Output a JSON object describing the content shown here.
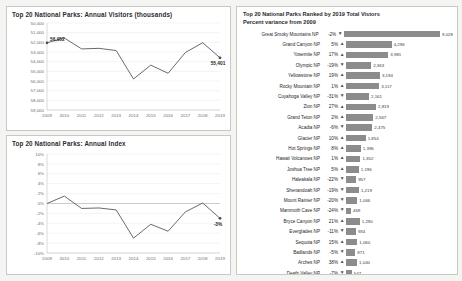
{
  "dashboard": {
    "background": "#f4f4f2",
    "accent": "#8c8c8c"
  },
  "visitors_panel": {
    "title": "Top 20 National Parks:  Annual Visitors (thousands)"
  },
  "index_panel": {
    "title": "Top 20 National Parks:  Annual Index"
  },
  "ranked_panel": {
    "title_line1": "Top 20 National Parks Ranked by 2019 Total Vistors",
    "title_line2": "Percent variance from 2009",
    "arrow_up": "▲",
    "arrow_down": "▼",
    "rows": [
      {
        "name": "Great Smoky Mountains NP",
        "pct": "-2%",
        "dir": "down",
        "value": "9,028",
        "value_num": 9028
      },
      {
        "name": "Grand Canyon NP",
        "pct": "5%",
        "dir": "up",
        "value": "4,296",
        "value_num": 4296
      },
      {
        "name": "Yosemite NP",
        "pct": "17%",
        "dir": "up",
        "value": "3,981",
        "value_num": 3981
      },
      {
        "name": "Olympic NP",
        "pct": "-19%",
        "dir": "down",
        "value": "2,363",
        "value_num": 2363
      },
      {
        "name": "Yellowstone NP",
        "pct": "19%",
        "dir": "up",
        "value": "3,194",
        "value_num": 3194
      },
      {
        "name": "Rocky Mountain NP",
        "pct": "1%",
        "dir": "up",
        "value": "3,117",
        "value_num": 3117
      },
      {
        "name": "Cuyahoga Valley NP",
        "pct": "-31%",
        "dir": "down",
        "value": "2,161",
        "value_num": 2161
      },
      {
        "name": "Zion NP",
        "pct": "27%",
        "dir": "up",
        "value": "2,819",
        "value_num": 2819
      },
      {
        "name": "Grand Teton NP",
        "pct": "2%",
        "dir": "up",
        "value": "2,567",
        "value_num": 2567
      },
      {
        "name": "Acadia NP",
        "pct": "-6%",
        "dir": "down",
        "value": "2,475",
        "value_num": 2475
      },
      {
        "name": "Glacier NP",
        "pct": "10%",
        "dir": "up",
        "value": "1,854",
        "value_num": 1854
      },
      {
        "name": "Hot Springs NP",
        "pct": "8%",
        "dir": "up",
        "value": "1,396",
        "value_num": 1396
      },
      {
        "name": "Hawaii Volcanoes NP",
        "pct": "1%",
        "dir": "up",
        "value": "1,352",
        "value_num": 1352
      },
      {
        "name": "Joshua Tree NP",
        "pct": "5%",
        "dir": "up",
        "value": "1,196",
        "value_num": 1196
      },
      {
        "name": "Haleakala NP",
        "pct": "-22%",
        "dir": "down",
        "value": "957",
        "value_num": 957
      },
      {
        "name": "Shenandoah NP",
        "pct": "-19%",
        "dir": "down",
        "value": "1,219",
        "value_num": 1219
      },
      {
        "name": "Mount Rainier NP",
        "pct": "-20%",
        "dir": "down",
        "value": "1,066",
        "value_num": 1066
      },
      {
        "name": "Mammoth Cave NP",
        "pct": "-24%",
        "dir": "down",
        "value": "469",
        "value_num": 469
      },
      {
        "name": "Bryce Canyon NP",
        "pct": "21%",
        "dir": "up",
        "value": "1,290",
        "value_num": 1290
      },
      {
        "name": "Everglades NP",
        "pct": "-11%",
        "dir": "down",
        "value": "934",
        "value_num": 934
      },
      {
        "name": "Sequoia NP",
        "pct": "15%",
        "dir": "up",
        "value": "1,060",
        "value_num": 1060
      },
      {
        "name": "Badlands NP",
        "pct": "-5%",
        "dir": "down",
        "value": "871",
        "value_num": 871
      },
      {
        "name": "Arches NP",
        "pct": "38%",
        "dir": "up",
        "value": "1,040",
        "value_num": 1040
      },
      {
        "name": "Death Valley NP",
        "pct": "-7%",
        "dir": "down",
        "value": "547",
        "value_num": 547
      },
      {
        "name": "Saguaro NP",
        "pct": "-18%",
        "dir": "down",
        "value": "610",
        "value_num": 610
      },
      {
        "name": "Wind Cave NP",
        "pct": "-17%",
        "dir": "down",
        "value": "598",
        "value_num": 598
      },
      {
        "name": "Virgin Islands NP",
        "pct": "-20%",
        "dir": "down",
        "value": "402",
        "value_num": 402
      },
      {
        "name": "Petrified Forest NP",
        "pct": "5%",
        "dir": "up",
        "value": "614",
        "value_num": 614
      },
      {
        "name": "Capitol Reef NP",
        "pct": "27%",
        "dir": "up",
        "value": "669",
        "value_num": 669
      }
    ]
  },
  "chart_data": [
    {
      "type": "line",
      "id": "annual-visitors",
      "title": "Top 20 National Parks:  Annual Visitors (thousands)",
      "xlabel": "",
      "ylabel": "",
      "x": [
        "2009",
        "2010",
        "2011",
        "2012",
        "2013",
        "2014",
        "2015",
        "2016",
        "2017",
        "2018",
        "2019"
      ],
      "values": [
        56952,
        57450,
        56320,
        56380,
        56150,
        53210,
        54640,
        53800,
        55950,
        56960,
        55401
      ],
      "ylim": [
        50000,
        59000
      ],
      "yticks": [
        "50,000",
        "51,000",
        "52,000",
        "53,000",
        "54,000",
        "55,000",
        "56,000",
        "57,000",
        "58,000",
        "59,000"
      ],
      "grid": true,
      "legend": "none",
      "annotations": [
        {
          "x": "2009",
          "y": 56952,
          "label": "56,952"
        },
        {
          "x": "2019",
          "y": 55401,
          "label": "55,401"
        }
      ]
    },
    {
      "type": "line",
      "id": "annual-index",
      "title": "Top 20 National Parks:  Annual Index",
      "xlabel": "",
      "ylabel": "",
      "x": [
        "2009",
        "2010",
        "2011",
        "2012",
        "2013",
        "2014",
        "2015",
        "2016",
        "2017",
        "2018",
        "2019"
      ],
      "values": [
        0,
        1.5,
        -1.0,
        -0.9,
        -1.3,
        -7.0,
        -4.2,
        -5.6,
        -1.7,
        0.1,
        -3.0
      ],
      "ylim": [
        -10,
        10
      ],
      "yticks": [
        "10%",
        "8%",
        "6%",
        "4%",
        "2%",
        "0%",
        "-2%",
        "-4%",
        "-6%",
        "-8%",
        "-10%"
      ],
      "grid": true,
      "legend": "none",
      "annotations": [
        {
          "x": "2019",
          "y": -3.0,
          "label": "-3%"
        }
      ]
    },
    {
      "type": "bar",
      "id": "ranked-parks",
      "title": "Top 20 National Parks Ranked by 2019 Total Vistors",
      "subtitle": "Percent variance from 2009",
      "orientation": "horizontal",
      "xlabel": "",
      "ylabel": "",
      "categories": [
        "Great Smoky Mountains NP",
        "Grand Canyon NP",
        "Yosemite NP",
        "Olympic NP",
        "Yellowstone NP",
        "Rocky Mountain NP",
        "Cuyahoga Valley NP",
        "Zion NP",
        "Grand Teton NP",
        "Acadia NP",
        "Glacier NP",
        "Hot Springs NP",
        "Hawaii Volcanoes NP",
        "Joshua Tree NP",
        "Haleakala NP",
        "Shenandoah NP",
        "Mount Rainier NP",
        "Mammoth Cave NP",
        "Bryce Canyon NP",
        "Everglades NP",
        "Sequoia NP",
        "Badlands NP",
        "Arches NP",
        "Death Valley NP",
        "Saguaro NP",
        "Wind Cave NP",
        "Virgin Islands NP",
        "Petrified Forest NP",
        "Capitol Reef NP"
      ],
      "values": [
        9028,
        4296,
        3981,
        2363,
        3194,
        3117,
        2161,
        2819,
        2567,
        2475,
        1854,
        1396,
        1352,
        1196,
        957,
        1219,
        1066,
        469,
        1290,
        934,
        1060,
        871,
        1040,
        547,
        610,
        598,
        402,
        614,
        669
      ],
      "percent_variance": [
        "-2%",
        "5%",
        "17%",
        "-19%",
        "19%",
        "1%",
        "-31%",
        "27%",
        "2%",
        "-6%",
        "10%",
        "8%",
        "1%",
        "5%",
        "-22%",
        "-19%",
        "-20%",
        "-24%",
        "21%",
        "-11%",
        "15%",
        "-5%",
        "38%",
        "-7%",
        "-18%",
        "-17%",
        "-20%",
        "5%",
        "27%"
      ],
      "xlim": [
        0,
        9028
      ]
    }
  ]
}
